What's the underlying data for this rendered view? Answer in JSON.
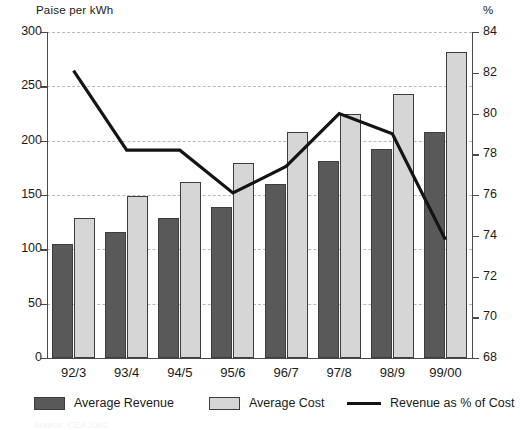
{
  "chart_data": {
    "type": "bar",
    "title": "",
    "categories": [
      "92/3",
      "93/4",
      "94/5",
      "95/6",
      "96/7",
      "97/8",
      "98/9",
      "99/00"
    ],
    "series": [
      {
        "name": "Average Revenue",
        "type": "bar",
        "axis": "left",
        "color": "#595959",
        "values": [
          105,
          116,
          129,
          139,
          160,
          181,
          192,
          208
        ]
      },
      {
        "name": "Average Cost",
        "type": "bar",
        "axis": "left",
        "color": "#d6d6d6",
        "values": [
          129,
          149,
          162,
          179,
          208,
          225,
          243,
          282
        ]
      },
      {
        "name": "Revenue as % of Cost",
        "type": "line",
        "axis": "right",
        "color": "#141414",
        "values": [
          82.1,
          78.2,
          78.2,
          76.1,
          77.4,
          80.0,
          79.0,
          73.8
        ]
      }
    ],
    "xlabel": "",
    "ylabel": "Paise per kWh",
    "y2label": "%",
    "ylim": [
      0,
      300
    ],
    "y2lim": [
      68,
      84
    ],
    "yticks": [
      0,
      50,
      100,
      150,
      200,
      250,
      300
    ],
    "y2ticks": [
      68,
      70,
      72,
      74,
      76,
      78,
      80,
      82,
      84
    ],
    "grid": true,
    "legend_position": "bottom"
  },
  "axes": {
    "left_title": "Paise per kWh",
    "right_title": "%",
    "left_ticks": [
      "300",
      "250",
      "200",
      "150",
      "100",
      "50",
      "0"
    ],
    "right_ticks": [
      "84",
      "82",
      "80",
      "78",
      "76",
      "74",
      "72",
      "70",
      "68"
    ],
    "x_ticks": [
      "92/3",
      "93/4",
      "94/5",
      "95/6",
      "96/7",
      "97/8",
      "98/9",
      "99/00"
    ]
  },
  "legend": {
    "items": [
      {
        "label": "Average Revenue",
        "marker": "bar-dark"
      },
      {
        "label": "Average Cost",
        "marker": "bar-light"
      },
      {
        "label": "Revenue as % of Cost",
        "marker": "line"
      }
    ]
  },
  "footnote": "Source: CEA 2001"
}
